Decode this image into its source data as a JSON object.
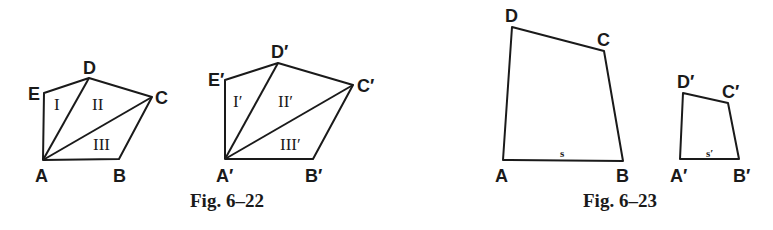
{
  "figures": [
    {
      "caption": "Fig. 6–22",
      "polygons": [
        {
          "name": "pentagon-ABCDE",
          "vertices": {
            "A": "A",
            "B": "B",
            "C": "C",
            "D": "D",
            "E": "E"
          },
          "regions": [
            "I",
            "II",
            "III"
          ]
        },
        {
          "name": "pentagon-A'B'C'D'E'",
          "vertices": {
            "A": "A′",
            "B": "B′",
            "C": "C′",
            "D": "D′",
            "E": "E′"
          },
          "regions": [
            "I′",
            "II′",
            "III′"
          ]
        }
      ]
    },
    {
      "caption": "Fig. 6–23",
      "polygons": [
        {
          "name": "quadrilateral-ABCD",
          "vertices": {
            "A": "A",
            "B": "B",
            "C": "C",
            "D": "D"
          },
          "side_label": "s"
        },
        {
          "name": "quadrilateral-A'B'C'D'",
          "vertices": {
            "A": "A′",
            "B": "B′",
            "C": "C′",
            "D": "D′"
          },
          "side_label": "s′"
        }
      ]
    }
  ],
  "colors": {
    "ink": "#1a1a1a",
    "background": "#ffffff"
  }
}
